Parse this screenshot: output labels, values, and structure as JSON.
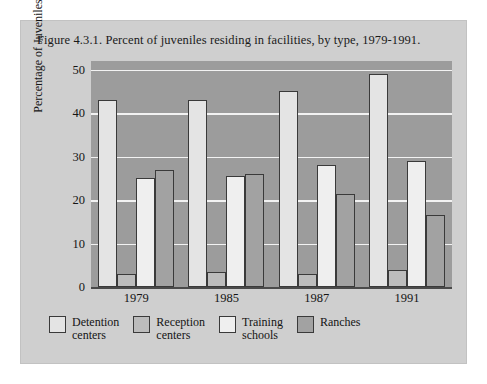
{
  "figure": {
    "title": "Figure 4.3.1. Percent of juveniles residing in facilities, by type, 1979-1991."
  },
  "colors": {
    "page_background": "#ffffff",
    "card_background": "#cfcfcf",
    "plot_background": "#9c9c9c",
    "gridline": "#f2f2f2",
    "series_detention": "#e4e4e4",
    "series_reception": "#bcbcbc",
    "series_training": "#efefef",
    "series_ranches": "#a2a2a2",
    "outline": "#3a3a3a",
    "text": "#151515"
  },
  "chart_data": {
    "type": "bar",
    "title": "Figure 4.3.1. Percent of juveniles residing in facilities, by type, 1979-1991.",
    "xlabel": "",
    "ylabel": "Percentage of Juveniles",
    "categories": [
      "1979",
      "1985",
      "1987",
      "1991"
    ],
    "yticks": [
      0,
      10,
      20,
      30,
      40,
      50
    ],
    "ylim": [
      0,
      52
    ],
    "grid": true,
    "legend_position": "bottom",
    "series": [
      {
        "name": "Detention\ncenters",
        "label": "Detention centers",
        "color": "#e4e4e4",
        "values": [
          43,
          43,
          45,
          49
        ]
      },
      {
        "name": "Reception\ncenters",
        "label": "Reception centers",
        "color": "#bcbcbc",
        "values": [
          3,
          3.5,
          3,
          4
        ]
      },
      {
        "name": "Training\nschools",
        "label": "Training schools",
        "color": "#efefef",
        "values": [
          25,
          25.5,
          28,
          29
        ]
      },
      {
        "name": "Ranches",
        "label": "Ranches",
        "color": "#a2a2a2",
        "values": [
          27,
          26,
          21.5,
          16.5
        ]
      }
    ]
  }
}
